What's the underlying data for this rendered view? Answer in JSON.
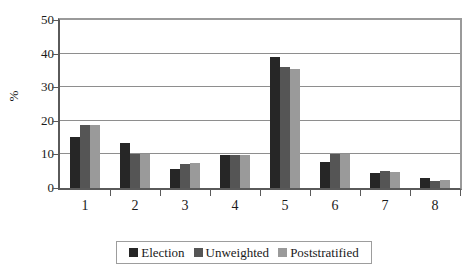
{
  "chart_data": {
    "type": "bar",
    "title": "",
    "subtitle": "",
    "xlabel": "",
    "ylabel": "%",
    "categories": [
      "1",
      "2",
      "3",
      "4",
      "5",
      "6",
      "7",
      "8"
    ],
    "series": [
      {
        "name": "Election",
        "color": "#262626",
        "values": [
          15.3,
          13.5,
          5.7,
          9.7,
          39.0,
          7.8,
          4.4,
          2.9
        ]
      },
      {
        "name": "Unweighted",
        "color": "#555555",
        "values": [
          18.8,
          10.0,
          7.0,
          9.7,
          36.0,
          10.2,
          5.0,
          2.1
        ]
      },
      {
        "name": "Poststratified",
        "color": "#9a9a9a",
        "values": [
          18.8,
          10.0,
          7.3,
          9.7,
          35.5,
          10.2,
          4.8,
          2.3
        ]
      }
    ],
    "ylim": [
      0,
      50
    ],
    "ytick_values": [
      0,
      10,
      20,
      30,
      40,
      50
    ],
    "ytick_labels": [
      "0",
      "10",
      "20",
      "30",
      "40",
      "50"
    ],
    "grid": true,
    "grid_axis": "y",
    "legend_position": "bottom",
    "legend_entries": [
      "Election",
      "Unweighted",
      "Poststratified"
    ]
  }
}
